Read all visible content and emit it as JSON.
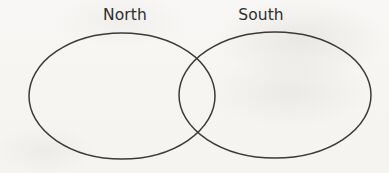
{
  "diagram": {
    "type": "venn-2-set",
    "title": "",
    "background_color": "#f7f6f3",
    "stroke_color": "#3a3a3a",
    "text_color": "#2e2e2e",
    "sets": [
      {
        "id": "north",
        "label": "North",
        "shape": "ellipse",
        "cx": 122,
        "cy": 96,
        "rx": 93,
        "ry": 63,
        "fill": "none",
        "label_x": 125,
        "label_y": 16
      },
      {
        "id": "south",
        "label": "South",
        "shape": "ellipse",
        "cx": 275,
        "cy": 95,
        "rx": 96,
        "ry": 63,
        "fill": "none",
        "label_x": 261,
        "label_y": 16
      }
    ],
    "intersection": {
      "label": "",
      "crossing_top": {
        "x": 197,
        "y": 60
      },
      "crossing_bottom": {
        "x": 197,
        "y": 136
      }
    },
    "stroke_width": 1.5
  },
  "labels": {
    "north": "North",
    "south": "South"
  }
}
